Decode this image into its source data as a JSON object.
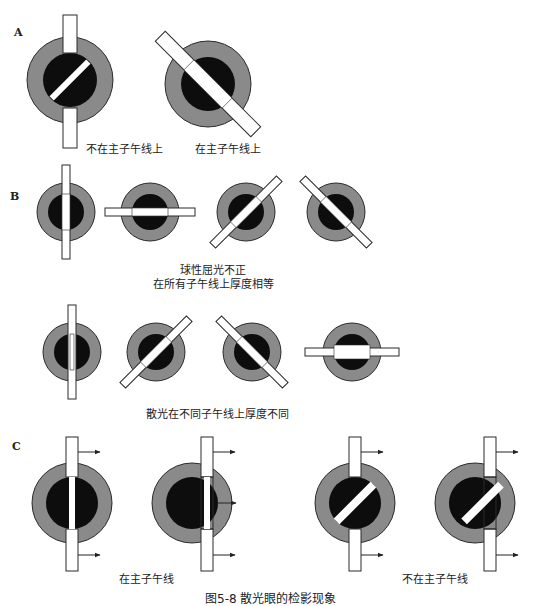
{
  "figure": {
    "caption": "图5-8 散光眼的检影现象",
    "colors": {
      "iris": "#8a8a8a",
      "pupil": "#0d0d0d",
      "outline": "#2a2a2a",
      "streak": "#ffffff",
      "arrow": "#222222"
    },
    "sections": {
      "A": {
        "letter": "A",
        "items": [
          {
            "id": "a1",
            "label": "不在主子午线上",
            "streak_angle_deg": 45,
            "beam_angle_deg": 90,
            "aligned": false
          },
          {
            "id": "a2",
            "label": "在主子午线上",
            "streak_angle_deg": -45,
            "beam_angle_deg": -45,
            "aligned": true
          }
        ]
      },
      "B": {
        "letter": "B",
        "rows": [
          {
            "caption_lines": [
              "球性屈光不正",
              "在所有子午线上厚度相等"
            ],
            "items": [
              {
                "beam_angle_deg": 90,
                "reflex_width": "equal"
              },
              {
                "beam_angle_deg": 0,
                "reflex_width": "equal"
              },
              {
                "beam_angle_deg": 45,
                "reflex_width": "equal"
              },
              {
                "beam_angle_deg": -45,
                "reflex_width": "equal"
              }
            ]
          },
          {
            "caption_lines": [
              "散光在不同子午线上厚度不同"
            ],
            "items": [
              {
                "beam_angle_deg": 90,
                "reflex_width": "thin"
              },
              {
                "beam_angle_deg": 45,
                "reflex_width": "medium"
              },
              {
                "beam_angle_deg": -45,
                "reflex_width": "medium"
              },
              {
                "beam_angle_deg": 0,
                "reflex_width": "thick"
              }
            ]
          }
        ]
      },
      "C": {
        "letter": "C",
        "groups": [
          {
            "label": "在主子午线",
            "items": [
              {
                "streak_angle_deg": 90,
                "motion": "with"
              },
              {
                "streak_angle_deg": 90,
                "motion": "with"
              }
            ]
          },
          {
            "label": "不在主子午线",
            "items": [
              {
                "streak_angle_deg": 45,
                "motion": "with"
              },
              {
                "streak_angle_deg": 45,
                "motion": "with"
              }
            ]
          }
        ]
      }
    }
  }
}
